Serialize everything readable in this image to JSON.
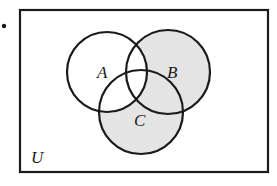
{
  "diagram": {
    "type": "venn",
    "bullet": "•",
    "universe": {
      "label": "U"
    },
    "sets": [
      {
        "id": "A",
        "label": "A"
      },
      {
        "id": "B",
        "label": "B"
      },
      {
        "id": "C",
        "label": "C"
      }
    ],
    "shaded_regions": [
      "B only",
      "C only",
      "B∩C not A"
    ],
    "shaded_expression": "(B ∪ C) − A",
    "colors": {
      "outline": "#1a1a1a",
      "shade": "#e4e4e4",
      "background": "#ffffff"
    }
  }
}
